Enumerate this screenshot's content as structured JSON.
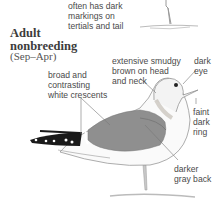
{
  "top_note": [
    "often has dark",
    "markings on",
    "tertials and tail"
  ],
  "section": {
    "title_line1": "Adult",
    "title_line2": "nonbreeding",
    "season": "(Sep–Apr)"
  },
  "labels": {
    "head": [
      "extensive smudgy",
      "brown on head",
      "and neck"
    ],
    "eye": [
      "dark",
      "eye"
    ],
    "wing": [
      "broad and",
      "contrasting",
      "white crescents"
    ],
    "bill": [
      "faint",
      "dark",
      "ring"
    ],
    "back": [
      "darker",
      "gray back"
    ]
  },
  "colors": {
    "back": "#8f8f8f",
    "wingtip": "#1a1a1a",
    "text": "#4a4a4a"
  }
}
